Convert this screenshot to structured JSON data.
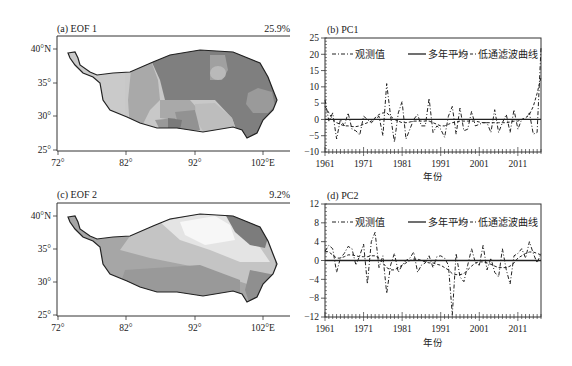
{
  "chart_data": [
    {
      "panel": "a",
      "type": "heatmap",
      "title": "(a) EOF 1",
      "variance_explained": "25.9%",
      "x_ticks": [
        "72°",
        "82°",
        "92°",
        "102°E"
      ],
      "y_ticks": [
        "40°N",
        "35°",
        "30°",
        "25°"
      ],
      "xlim": [
        72,
        106
      ],
      "ylim": [
        25,
        42
      ],
      "description": "Grayscale EOF1 spatial pattern over the Tibetan Plateau; darker shading in the central/eastern plateau, lighter in the west and south-central",
      "grid": false
    },
    {
      "panel": "b",
      "type": "line",
      "title": "(b) PC1",
      "xlabel": "年份",
      "ylabel": "",
      "x_ticks": [
        "1961",
        "1971",
        "1981",
        "1991",
        "2001",
        "2011"
      ],
      "y_ticks": [
        25,
        20,
        15,
        10,
        5,
        0,
        -5,
        -10
      ],
      "ylim": [
        -10,
        25
      ],
      "xlim": [
        1961,
        2017
      ],
      "legend": [
        "观测值",
        "多年平均",
        "低通滤波曲线"
      ],
      "legend_position": "top",
      "x": [
        1961,
        1962,
        1963,
        1964,
        1965,
        1966,
        1967,
        1968,
        1969,
        1970,
        1971,
        1972,
        1973,
        1974,
        1975,
        1976,
        1977,
        1978,
        1979,
        1980,
        1981,
        1982,
        1983,
        1984,
        1985,
        1986,
        1987,
        1988,
        1989,
        1990,
        1991,
        1992,
        1993,
        1994,
        1995,
        1996,
        1997,
        1998,
        1999,
        2000,
        2001,
        2002,
        2003,
        2004,
        2005,
        2006,
        2007,
        2008,
        2009,
        2010,
        2011,
        2012,
        2013,
        2014,
        2015,
        2016,
        2017
      ],
      "series": [
        {
          "name": "观测值",
          "style": "dash-dot",
          "values": [
            6,
            -0.5,
            2,
            -6,
            0,
            -2,
            2,
            -3,
            -3.5,
            -4.8,
            1,
            0,
            -1,
            0,
            1,
            -5,
            11,
            1,
            -7,
            2,
            5.5,
            -6,
            -3,
            0,
            1.5,
            -2,
            -2,
            6.5,
            -4,
            -2,
            -3,
            -5.5,
            1,
            4,
            -4.5,
            3.5,
            -3.5,
            -3,
            2.5,
            -2,
            -1.5,
            -1,
            -1,
            -4,
            3,
            -4,
            -1,
            1.5,
            -4,
            3,
            -3,
            0,
            0,
            2,
            -4.5,
            -4,
            22
          ]
        },
        {
          "name": "多年平均",
          "style": "solid",
          "values": [
            0,
            0,
            0,
            0,
            0,
            0,
            0,
            0,
            0,
            0,
            0,
            0,
            0,
            0,
            0,
            0,
            0,
            0,
            0,
            0,
            0,
            0,
            0,
            0,
            0,
            0,
            0,
            0,
            0,
            0,
            0,
            0,
            0,
            0,
            0,
            0,
            0,
            0,
            0,
            0,
            0,
            0,
            0,
            0,
            0,
            0,
            0,
            0,
            0,
            0,
            0,
            0,
            0,
            0,
            0,
            0,
            0
          ]
        },
        {
          "name": "低通滤波曲线",
          "style": "dashed",
          "values": [
            4,
            2,
            0,
            -1,
            -1.5,
            -2,
            -2,
            -2.2,
            -2.2,
            -2,
            -1.5,
            -1,
            -0.5,
            0.5,
            1.5,
            2,
            2,
            1,
            0,
            -0.5,
            -1,
            -1,
            -0.8,
            -0.5,
            -0.5,
            -0.5,
            -0.5,
            -0.5,
            -1,
            -1.5,
            -2,
            -2,
            -1.5,
            -1,
            -0.8,
            -0.5,
            -0.5,
            -0.5,
            -0.5,
            -0.5,
            -0.8,
            -1,
            -1,
            -1,
            -1,
            -1,
            -1,
            -1,
            -0.8,
            -0.5,
            -0.5,
            0,
            0.5,
            1.5,
            4,
            8,
            13
          ]
        }
      ]
    },
    {
      "panel": "c",
      "type": "heatmap",
      "title": "(c) EOF 2",
      "variance_explained": "9.2%",
      "x_ticks": [
        "72°",
        "82°",
        "92°",
        "102°E"
      ],
      "y_ticks": [
        "40°N",
        "35°",
        "30°",
        "25°"
      ],
      "xlim": [
        72,
        106
      ],
      "ylim": [
        25,
        42
      ],
      "description": "Grayscale EOF2 spatial pattern; white/light band across north-central plateau, medium gray in south and west, dark gray in the northeast",
      "grid": false
    },
    {
      "panel": "d",
      "type": "line",
      "title": "(d) PC2",
      "xlabel": "年份",
      "ylabel": "",
      "x_ticks": [
        "1961",
        "1971",
        "1981",
        "1991",
        "2001",
        "2011"
      ],
      "y_ticks": [
        12,
        8,
        4,
        0,
        -4,
        -8,
        -12
      ],
      "ylim": [
        -12,
        12
      ],
      "xlim": [
        1961,
        2017
      ],
      "legend": [
        "观测值",
        "多年平均",
        "低通滤波曲线"
      ],
      "legend_position": "top",
      "x": [
        1961,
        1962,
        1963,
        1964,
        1965,
        1966,
        1967,
        1968,
        1969,
        1970,
        1971,
        1972,
        1973,
        1974,
        1975,
        1976,
        1977,
        1978,
        1979,
        1980,
        1981,
        1982,
        1983,
        1984,
        1985,
        1986,
        1987,
        1988,
        1989,
        1990,
        1991,
        1992,
        1993,
        1994,
        1995,
        1996,
        1997,
        1998,
        1999,
        2000,
        2001,
        2002,
        2003,
        2004,
        2005,
        2006,
        2007,
        2008,
        2009,
        2010,
        2011,
        2012,
        2013,
        2014,
        2015,
        2016,
        2017
      ],
      "series": [
        {
          "name": "观测值",
          "style": "dash-dot",
          "values": [
            2,
            3.2,
            2.5,
            -2.5,
            0.5,
            1.5,
            3,
            2.5,
            -1,
            1,
            3.5,
            -5,
            4,
            6,
            -1.5,
            1,
            -7,
            -1,
            1.5,
            -2.5,
            -1,
            0,
            0.5,
            1.8,
            -2.5,
            -1,
            -0.5,
            1,
            -1.5,
            0.8,
            1,
            0.5,
            -1,
            -11.5,
            1.5,
            -3.5,
            -4.5,
            -1,
            2.5,
            -0.5,
            -1,
            3.2,
            -2,
            0.5,
            -2.5,
            -3.5,
            2.5,
            -2,
            -5,
            1,
            1.5,
            2.5,
            0.5,
            4,
            1.5,
            -0.5,
            1.5
          ]
        },
        {
          "name": "多年平均",
          "style": "solid",
          "values": [
            0,
            0,
            0,
            0,
            0,
            0,
            0,
            0,
            0,
            0,
            0,
            0,
            0,
            0,
            0,
            0,
            0,
            0,
            0,
            0,
            0,
            0,
            0,
            0,
            0,
            0,
            0,
            0,
            0,
            0,
            0,
            0,
            0,
            0,
            0,
            0,
            0,
            0,
            0,
            0,
            0,
            0,
            0,
            0,
            0,
            0,
            0,
            0,
            0,
            0,
            0,
            0,
            0,
            0,
            0,
            0,
            0
          ]
        },
        {
          "name": "低通滤波曲线",
          "style": "dashed",
          "values": [
            2,
            1.8,
            1.2,
            0.5,
            0.5,
            0.8,
            1.2,
            1.2,
            1,
            0.8,
            0.8,
            0.8,
            1,
            1,
            0.5,
            -0.5,
            -1.5,
            -2,
            -2,
            -1.5,
            -1,
            -0.5,
            0,
            0.3,
            0.3,
            0,
            -0.3,
            -0.5,
            -0.5,
            -0.8,
            -1,
            -1.5,
            -2,
            -2.8,
            -3,
            -3,
            -2.8,
            -2,
            -1.2,
            -0.5,
            -0.3,
            -0.3,
            -0.5,
            -0.8,
            -1.2,
            -1.5,
            -1.5,
            -1.5,
            -1.2,
            -0.5,
            0.5,
            1,
            1.5,
            1.8,
            1.8,
            1.5,
            1.2
          ]
        }
      ]
    }
  ],
  "labels": {
    "panel_a": {
      "title": "(a) EOF 1",
      "pct": "25.9%"
    },
    "panel_b": {
      "title": "(b) PC1",
      "xlabel": "年份"
    },
    "panel_c": {
      "title": "(c) EOF 2",
      "pct": "9.2%"
    },
    "panel_d": {
      "title": "(d) PC2",
      "xlabel": "年份"
    },
    "legend": {
      "observed": "观测值",
      "mean": "多年平均",
      "lowpass": "低通滤波曲线"
    },
    "map_x_ticks": [
      "72°",
      "82°",
      "92°",
      "102°E"
    ],
    "map_y_ticks": [
      "40°N",
      "35°",
      "30°",
      "25°"
    ],
    "year_ticks": [
      "1961",
      "1971",
      "1981",
      "1991",
      "2001",
      "2011"
    ],
    "pc1_y_ticks": [
      "25",
      "20",
      "15",
      "10",
      "5",
      "0",
      "−5",
      "−10"
    ],
    "pc2_y_ticks": [
      "12",
      "8",
      "4",
      "0",
      "−4",
      "−8",
      "−12"
    ]
  }
}
